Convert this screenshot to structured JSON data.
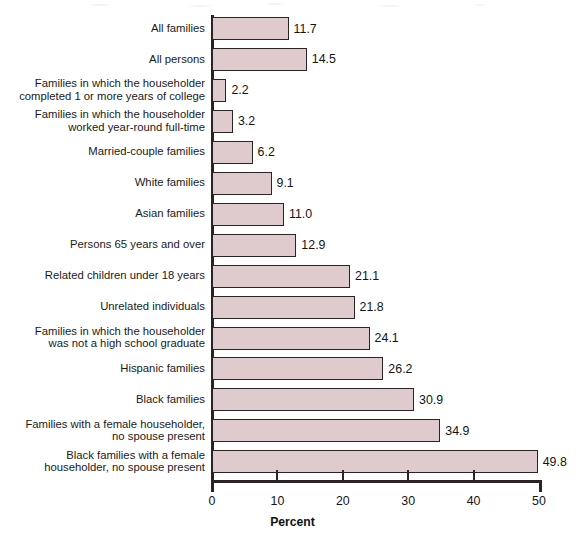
{
  "chart_data": {
    "type": "bar",
    "orientation": "horizontal",
    "title": "",
    "subtitle": "",
    "xlabel": "Percent",
    "ylabel": "",
    "xlim": [
      0,
      50
    ],
    "xticks": [
      0,
      10,
      20,
      30,
      40,
      50
    ],
    "xtick_labels": [
      "0",
      "10",
      "20",
      "30",
      "40",
      "50"
    ],
    "grid": false,
    "legend": false,
    "value_labels": true,
    "bar_fill_color": "#dfcbcd",
    "bar_edge_color": "#2b2324",
    "axis_color": "#2b2324",
    "background_color": "#ffffff",
    "categories": [
      "All families",
      "All persons",
      "Families in which the householder\ncompleted 1 or more years of college",
      "Families in which the householder\nworked year-round full-time",
      "Married-couple families",
      "White families",
      "Asian families",
      "Persons 65 years and over",
      "Related children under 18 years",
      "Unrelated individuals",
      "Families in which the householder\nwas not a high school graduate",
      "Hispanic families",
      "Black families",
      "Families with a female householder,\nno spouse present",
      "Black families with a female\nhouseholder, no spouse present"
    ],
    "values": [
      11.7,
      14.5,
      2.2,
      3.2,
      6.2,
      9.1,
      11.0,
      12.9,
      21.1,
      21.8,
      24.1,
      26.2,
      30.9,
      34.9,
      49.8
    ],
    "value_label_texts": [
      "11.7",
      "14.5",
      "2.2",
      "3.2",
      "6.2",
      "9.1",
      "11.0",
      "12.9",
      "21.1",
      "21.8",
      "24.1",
      "26.2",
      "30.9",
      "34.9",
      "49.8"
    ]
  }
}
